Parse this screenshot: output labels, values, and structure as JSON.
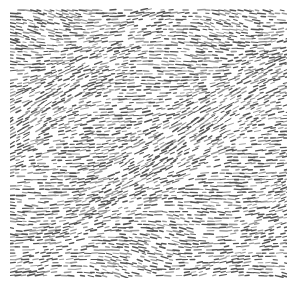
{
  "image": {
    "description": "Grayscale texture of short dark dash strokes on white, flowing in wavy diagonal patterns",
    "colors": {
      "background": "#ffffff",
      "stroke": "#555555",
      "stroke_light": "#999999"
    },
    "texture_bounds": {
      "x": 10,
      "y": 8,
      "width": 277,
      "height": 270
    }
  }
}
